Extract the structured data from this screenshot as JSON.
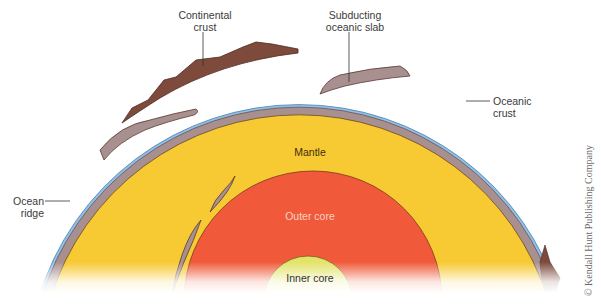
{
  "figure": {
    "labels": {
      "continental_crust": [
        "Continental",
        "crust"
      ],
      "subducting_slab": [
        "Subducting",
        "oceanic slab"
      ],
      "oceanic_crust": [
        "Oceanic",
        "crust"
      ],
      "ocean_ridge": [
        "Ocean",
        "ridge"
      ],
      "mantle": "Mantle",
      "outer_core": "Outer core",
      "inner_core": "Inner core"
    },
    "copyright": "© Kendall Hunt Publishing Company"
  },
  "colors": {
    "mantle": "#f7c933",
    "outer_core": "#f05a3a",
    "inner_core": "#e3e36a",
    "oceanic_crust": "#a89090",
    "continental_crust": "#7d4a3c",
    "ocean": "#8fc0e6",
    "outline": "#5a3a20"
  }
}
